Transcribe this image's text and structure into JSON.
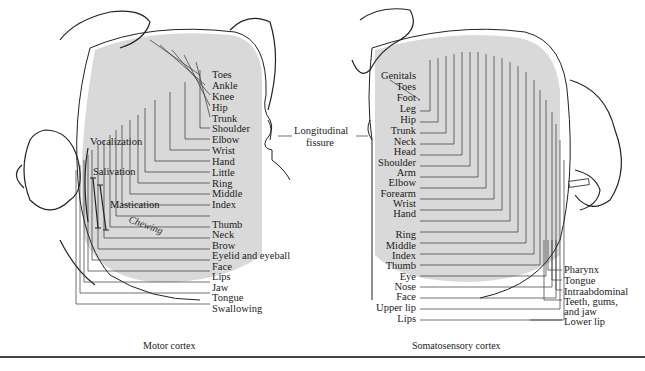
{
  "figure": {
    "motor": {
      "caption": "Motor cortex",
      "labels": [
        "Toes",
        "Ankle",
        "Knee",
        "Hip",
        "Trunk",
        "Shoulder",
        "Elbow",
        "Wrist",
        "Hand",
        "Little",
        "Ring",
        "Middle",
        "Index",
        "Thumb",
        "Neck",
        "Brow",
        "Eyelid and eyeball",
        "Face",
        "Lips",
        "Jaw",
        "Tongue",
        "Swallowing"
      ],
      "side_labels": [
        "Vocalization",
        "Salivation",
        "Mastication"
      ],
      "handwritten": "Chewing"
    },
    "fissure": {
      "line1": "Longitudinal",
      "line2": "fissure"
    },
    "sensory": {
      "caption": "Somatosensory cortex",
      "labels": [
        "Genitals",
        "Toes",
        "Foot",
        "Leg",
        "Hip",
        "Trunk",
        "Neck",
        "Head",
        "Shoulder",
        "Arm",
        "Elbow",
        "Forearm",
        "Wrist",
        "Hand",
        "Ring",
        "Middle",
        "Index",
        "Thumb",
        "Eye",
        "Nose",
        "Face",
        "Upper lip",
        "Lips"
      ],
      "right_labels": [
        "Pharynx",
        "Tongue",
        "Intraabdominal",
        "Teeth, gums,",
        "and jaw",
        "Lower lip"
      ]
    },
    "colors": {
      "shade": "#d9d9d9",
      "ink": "#1a1a1a",
      "rule": "#444444"
    }
  }
}
